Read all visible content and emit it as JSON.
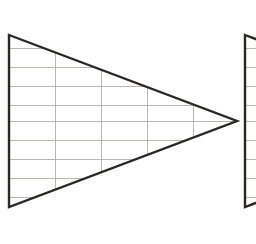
{
  "figure": {
    "canvas": {
      "width": 256,
      "height": 244,
      "background_color": "#ffffff"
    },
    "style": {
      "outline_color": "#2b2722",
      "outline_width": 2.4,
      "grid_color": "#b3b0ab",
      "grid_width": 0.9
    },
    "shapes": [
      {
        "name": "main-triangle",
        "label": "Left triangle",
        "apex": {
          "x": 237,
          "y": 121
        },
        "top_left": {
          "x": 9,
          "y": 35
        },
        "bottom_left": {
          "x": 9,
          "y": 207
        },
        "grid": {
          "horizontal_lines_y": [
            48,
            67,
            86,
            105,
            121,
            140,
            159,
            178,
            197
          ],
          "vertical_lines_x": [
            55,
            101,
            147,
            193
          ],
          "row_spacing": 19,
          "column_spacing": 46
        }
      },
      {
        "name": "second-triangle-clipped",
        "label": "Right triangle (clipped)",
        "apex": {
          "x": 473,
          "y": 121
        },
        "top_left": {
          "x": 245,
          "y": 35
        },
        "bottom_left": {
          "x": 245,
          "y": 207
        },
        "grid": {
          "horizontal_lines_y": [
            48,
            67,
            86,
            105,
            121,
            140,
            159,
            178,
            197
          ],
          "vertical_lines_x": [
            291,
            337,
            383,
            429
          ],
          "row_spacing": 19,
          "column_spacing": 46
        }
      }
    ]
  }
}
